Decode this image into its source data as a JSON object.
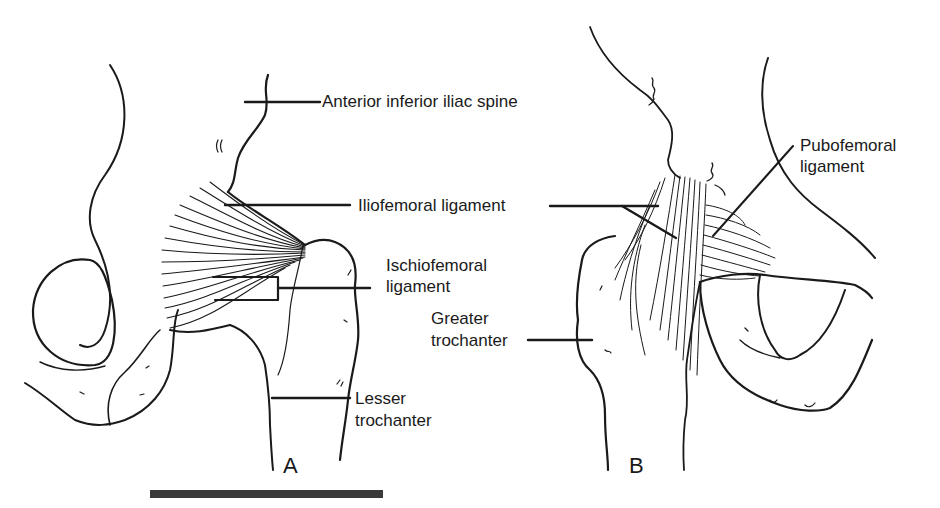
{
  "figure": {
    "panels": [
      {
        "id": "A",
        "label": "A"
      },
      {
        "id": "B",
        "label": "B"
      }
    ],
    "labels": {
      "anterior_inferior_iliac_spine": "Anterior inferior iliac spine",
      "iliofemoral_ligament": "Iliofemoral ligament",
      "ischiofemoral_ligament_line1": "Ischiofemoral",
      "ischiofemoral_ligament_line2": "ligament",
      "lesser_trochanter_line1": "Lesser",
      "lesser_trochanter_line2": "trochanter",
      "greater_trochanter_line1": "Greater",
      "greater_trochanter_line2": "trochanter",
      "pubofemoral_ligament_line1": "Pubofemoral",
      "pubofemoral_ligament_line2": "ligament"
    },
    "colors": {
      "ink": "#1a1a1a",
      "background": "#ffffff",
      "scale_bar": "#3a3a3a"
    }
  }
}
